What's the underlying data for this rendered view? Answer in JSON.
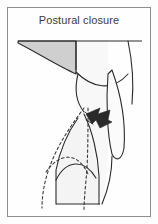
{
  "figure": {
    "title": "Postural closure",
    "panel": {
      "width": 158,
      "height": 224,
      "background_color": "#fdfdfd",
      "border_color": "#8d8d8d",
      "inner_background": "#fefefe"
    },
    "colors": {
      "outline": "#2b2b2b",
      "title_text": "#3b3b3b",
      "shaded_wedge_fill": "#cfcfcf",
      "light_fill": "#f1f1f1",
      "pale_fill": "#f7f7f7",
      "arrow_fill": "#2a2a2a",
      "dashed_line": "#3a3a3a"
    },
    "type": "line-drawing",
    "caption_position": "top-center",
    "elements": [
      {
        "name": "top-baseline",
        "kind": "line",
        "description": "horizontal reference line across upper figure"
      },
      {
        "name": "shaded-wedge",
        "kind": "filled-region",
        "fill": "#cfcfcf",
        "description": "gray curved triangular wedge at upper left"
      },
      {
        "name": "upper-body-outline",
        "kind": "outline",
        "description": "curved contour descending from baseline to mid figure"
      },
      {
        "name": "right-narrow-limb",
        "kind": "outline",
        "description": "elongated narrow shape along right side"
      },
      {
        "name": "closure-arrow",
        "kind": "arrow",
        "fill": "#2a2a2a",
        "direction": "left",
        "description": "solid dark arrow indicating direction of closure"
      },
      {
        "name": "lower-body-outline",
        "kind": "outline",
        "description": "solid contour of lower structure in closed position"
      },
      {
        "name": "reference-dashed-outline",
        "kind": "dashed-outline",
        "description": "dashed contour showing prior or open position"
      },
      {
        "name": "bottom-baseline",
        "kind": "line",
        "description": "horizontal line at base of figure"
      }
    ]
  }
}
